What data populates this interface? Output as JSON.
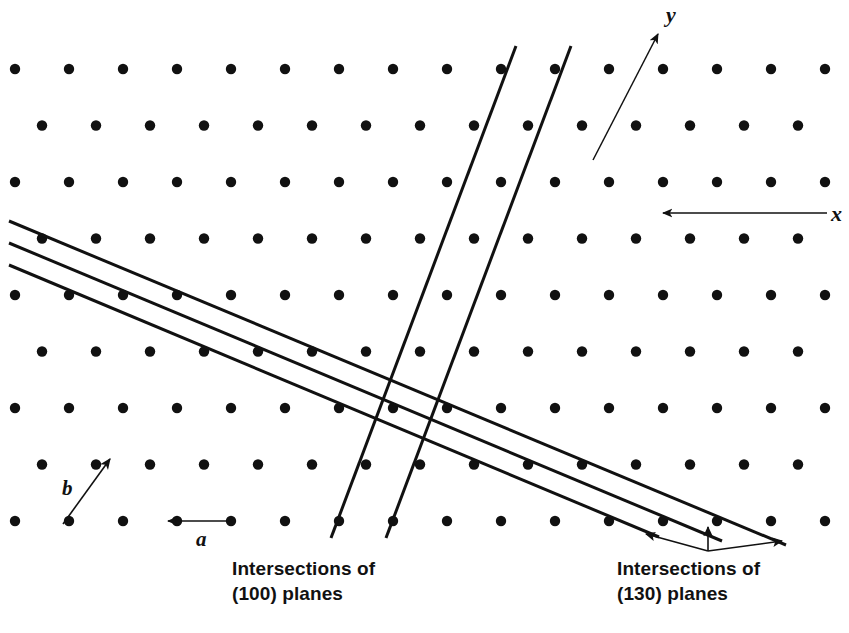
{
  "figure": {
    "background_color": "#ffffff",
    "ink_color": "#111111",
    "width": 849,
    "height": 633
  },
  "captions": {
    "left": "Intersections of\n(100) planes",
    "right": "Intersections of\n(130) planes"
  },
  "axes": {
    "y_label": "y",
    "x_label": "x",
    "y_arrow": {
      "x1": 593,
      "y1": 160,
      "x2": 658,
      "y2": 34
    },
    "x_arrow": {
      "x1": 827,
      "y1": 213,
      "x2": 663,
      "y2": 213
    }
  },
  "cell_vectors": {
    "a_label": "a",
    "b_label": "b",
    "a_arrow": {
      "x1": 232,
      "y1": 521,
      "x2": 168,
      "y2": 521
    },
    "b_arrow": {
      "x1": 63,
      "y1": 524,
      "x2": 110,
      "y2": 459
    }
  },
  "lattice": {
    "type": "centered-rectangular",
    "dot_radius": 5.2,
    "dot_color": "#111111",
    "row_spacing": 56.5,
    "column_spacing": 54,
    "first_row_y": 69,
    "odd_row_x0": 15,
    "even_row_x0": 42,
    "odd_row_count": 16,
    "even_row_count": 15,
    "rows": 9,
    "row_y": [
      69,
      125.5,
      182,
      238.5,
      295,
      351.5,
      408,
      464.5,
      521
    ]
  },
  "planes": {
    "p100": {
      "label": "(100)",
      "stroke_width": 3.0,
      "lines": [
        {
          "x1": 516,
          "y1": 46,
          "x2": 331,
          "y2": 538
        },
        {
          "x1": 571,
          "y1": 46,
          "x2": 386,
          "y2": 538
        }
      ]
    },
    "p130": {
      "label": "(130)",
      "stroke_width": 3.0,
      "lines": [
        {
          "x1": 9,
          "y1": 221,
          "x2": 786,
          "y2": 545
        },
        {
          "x1": 9,
          "y1": 243,
          "x2": 722,
          "y2": 541
        },
        {
          "x1": 9,
          "y1": 265,
          "x2": 659,
          "y2": 537
        }
      ]
    }
  },
  "pointer_arrows": {
    "origin": {
      "x": 708,
      "y": 551
    },
    "tips": [
      {
        "x": 646,
        "y": 534
      },
      {
        "x": 708,
        "y": 527
      },
      {
        "x": 782,
        "y": 541
      }
    ]
  }
}
